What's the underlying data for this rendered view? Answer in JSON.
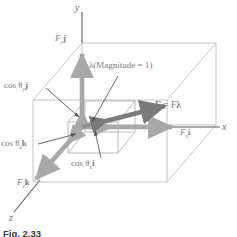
{
  "figure": {
    "caption": "Fig. 2.33",
    "axes": {
      "y": "y",
      "x": "x",
      "z": "z"
    },
    "labels": {
      "force_y_component": {
        "base": "F",
        "sub": "y",
        "unit": "j"
      },
      "force_x_component": {
        "base": "F",
        "sub": "x",
        "unit": "i"
      },
      "force_z_component": {
        "base": "F",
        "sub": "z",
        "unit": "k"
      },
      "cos_theta_y": {
        "prefix": "cos ",
        "theta": "θ",
        "sub": "y",
        "unit": "j"
      },
      "cos_theta_x": {
        "prefix": "cos ",
        "theta": "θ",
        "sub": "x",
        "unit": "i"
      },
      "cos_theta_z": {
        "prefix": "cos ",
        "theta": "θ",
        "sub": "z",
        "unit": "k"
      },
      "lambda_annotation": "λ(Magnitude = 1)",
      "force_vector": {
        "lhs": "F",
        "eq": " = ",
        "mag": "F",
        "dir": "λ"
      }
    },
    "colors": {
      "line_gray": "#9a9a9a",
      "arrow_gray": "#a8a8a8",
      "arrow_dark": "#7b7b7b",
      "leader_dark": "#5e5e5e",
      "text_gray": "#7d7d7d",
      "caption_dark": "#3b3b3b",
      "box_light": "#bdbdbd"
    }
  }
}
